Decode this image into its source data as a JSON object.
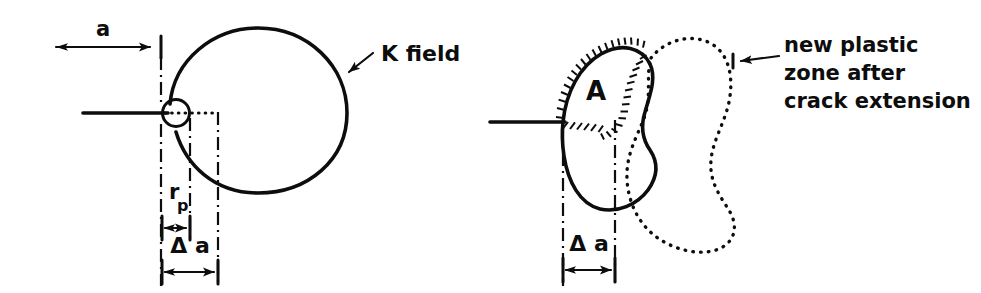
{
  "figure": {
    "background_color": "#ffffff",
    "ink_color": "#0d0d0d",
    "width": 981,
    "height": 293
  },
  "left_panel": {
    "name": "k-field-panel",
    "labels": {
      "crack_length": "a",
      "plastic_zone_radius_base": "r",
      "plastic_zone_radius_sub": "p",
      "crack_extension": "Δ a",
      "k_field": "K field"
    },
    "elements": {
      "crack_line": "crack-line",
      "plastic_zone_circle": "plastic-zone-circle",
      "k_field_boundary": "k-field-boundary",
      "dotted_radius_line": "dotted-radius-line",
      "leader_arrow": "k-field-leader-arrow"
    }
  },
  "right_panel": {
    "name": "plastic-zone-extension-panel",
    "labels": {
      "region": "A",
      "crack_extension": "Δ a",
      "callout_line_1": "new plastic",
      "callout_line_2": "zone after",
      "callout_line_3": "crack extension"
    },
    "elements": {
      "crack_line": "crack-line",
      "old_plastic_zone": "old-plastic-zone-outline",
      "new_plastic_zone": "new-plastic-zone-outline-dotted",
      "hatched_region": "hatched-region-a",
      "leader_arrow": "new-plastic-zone-leader-arrow"
    }
  }
}
